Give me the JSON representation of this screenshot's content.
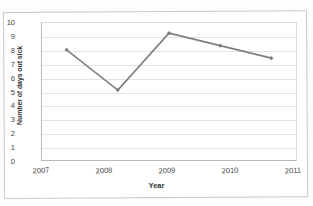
{
  "chart_data": {
    "type": "line",
    "title": "",
    "xlabel": "Year",
    "ylabel": "Number of days out sick",
    "categories": [
      "2007",
      "2008",
      "2009",
      "2010",
      "2011"
    ],
    "values": [
      8.0,
      5.1,
      9.2,
      8.3,
      7.4
    ],
    "series": [
      {
        "name": "Number of days out sick",
        "values": [
          8.0,
          5.1,
          9.2,
          8.3,
          7.4
        ]
      }
    ],
    "ylim": [
      0,
      10
    ],
    "yticks": [
      "0",
      "1",
      "2",
      "3",
      "4",
      "5",
      "6",
      "7",
      "8",
      "9",
      "10"
    ],
    "grid": "horizontal",
    "legend": "none",
    "line_color": "#808080",
    "marker_color": "#7d7d7d",
    "gridline_color": "#e2e2e2",
    "axis_color": "#b9b9b9"
  }
}
